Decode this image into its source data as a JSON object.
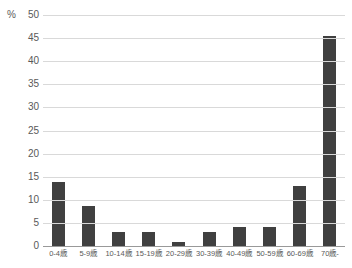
{
  "chart_data": {
    "type": "bar",
    "title": "",
    "unit": "%",
    "categories": [
      "0-4歳",
      "5-9歳",
      "10-14歳",
      "15-19歳",
      "20-29歳",
      "30-39歳",
      "40-49歳",
      "50-59歳",
      "60-69歳",
      "70歳-"
    ],
    "values": [
      13.9,
      8.7,
      3.0,
      3.0,
      0.9,
      3.0,
      4.1,
      4.1,
      13.0,
      45.4
    ],
    "xlabel": "",
    "ylabel": "%",
    "ylim": [
      0,
      50
    ],
    "ytick_step": 5,
    "ytick_labels": [
      "0",
      "5",
      "10",
      "15",
      "20",
      "25",
      "30",
      "35",
      "40",
      "45",
      "50"
    ],
    "grid": true,
    "legend": false,
    "colors": {
      "bar": "#404040",
      "gridline": "#d9d9d9",
      "axis_line": "#999999",
      "text": "#595959",
      "background": "#ffffff"
    }
  }
}
